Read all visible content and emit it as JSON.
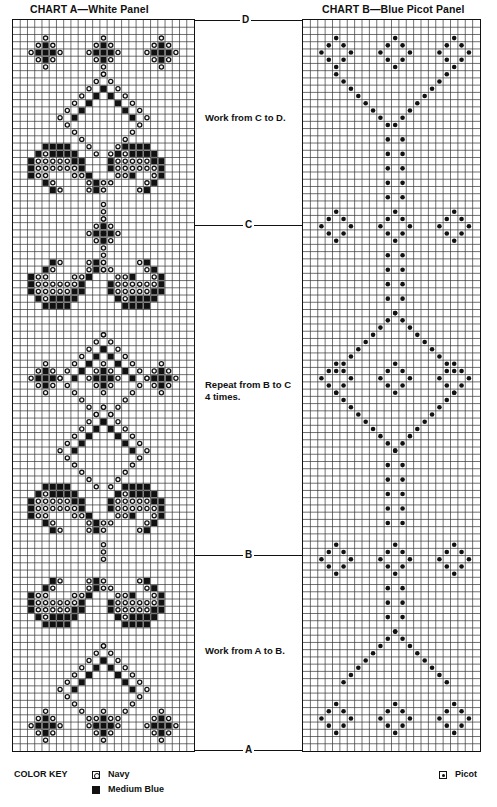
{
  "charts": {
    "a": {
      "title": "CHART A—White Panel",
      "cols": 25,
      "rows": 101
    },
    "b": {
      "title": "CHART B—Blue Picot Panel",
      "cols": 24,
      "rows": 101
    }
  },
  "markers": {
    "d": {
      "label": "D",
      "y": 20
    },
    "c": {
      "label": "C",
      "y": 225
    },
    "b": {
      "label": "B",
      "y": 556
    },
    "a": {
      "label": "A",
      "y": 750
    }
  },
  "instructions": {
    "c_to_d": "Work from C to D.",
    "repeat_line1": "Repeat from B to C",
    "repeat_line2": "4 times.",
    "a_to_b": "Work from A to B."
  },
  "color_key": {
    "title": "COLOR KEY",
    "items": [
      {
        "symbol": "navy-ring",
        "label": "Navy"
      },
      {
        "symbol": "filled-square",
        "label": "Medium Blue"
      },
      {
        "symbol": "picot-dot",
        "label": "Picot"
      }
    ]
  },
  "icons": {
    "navy": "open-circle",
    "medium_blue": "filled-square",
    "picot": "filled-dot"
  },
  "colors": {
    "ink": "#111111",
    "paper": "#ffffff",
    "grid_line": "#333333"
  }
}
